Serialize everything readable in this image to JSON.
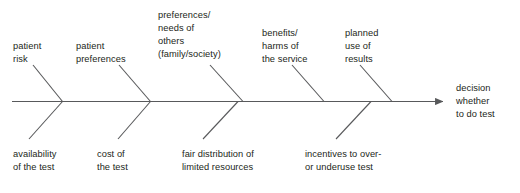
{
  "diagram": {
    "type": "fishbone-ishikawa",
    "title_text": "",
    "spine": {
      "label_lines": [
        "decision",
        "whether",
        "to do test"
      ],
      "label_text": "decision whether to do test"
    },
    "stroke_color": "#58595b",
    "text_color": "#231f20",
    "background": "#ffffff",
    "top_branches": [
      {
        "id": "patient-risk",
        "lines": [
          "patient",
          "risk"
        ],
        "text": "patient risk"
      },
      {
        "id": "patient-preferences",
        "lines": [
          "patient",
          "preferences"
        ],
        "text": "patient preferences"
      },
      {
        "id": "preferences-needs-of-others",
        "lines": [
          "preferences/",
          "needs of",
          "others",
          "(family/society)"
        ],
        "text": "preferences/ needs of others (family/society)"
      },
      {
        "id": "benefits-harms-of-the-service",
        "lines": [
          "benefits/",
          "harms of",
          "the service"
        ],
        "text": "benefits/ harms of the service"
      },
      {
        "id": "planned-use-of-results",
        "lines": [
          "planned",
          "use of",
          "results"
        ],
        "text": "planned use of results"
      }
    ],
    "bottom_branches": [
      {
        "id": "availability-of-the-test",
        "lines": [
          "availability",
          "of the test"
        ],
        "text": "availability of the test"
      },
      {
        "id": "cost-of-the-test",
        "lines": [
          "cost of",
          "the test"
        ],
        "text": "cost of the test"
      },
      {
        "id": "fair-distribution-of-limited-resources",
        "lines": [
          "fair distribution of",
          "limited resources"
        ],
        "text": "fair distribution of limited resources"
      },
      {
        "id": "incentives-to-over-or-underuse-test",
        "lines": [
          "incentives to over-",
          "or underuse test"
        ],
        "text": "incentives to over- or underuse test"
      }
    ]
  }
}
